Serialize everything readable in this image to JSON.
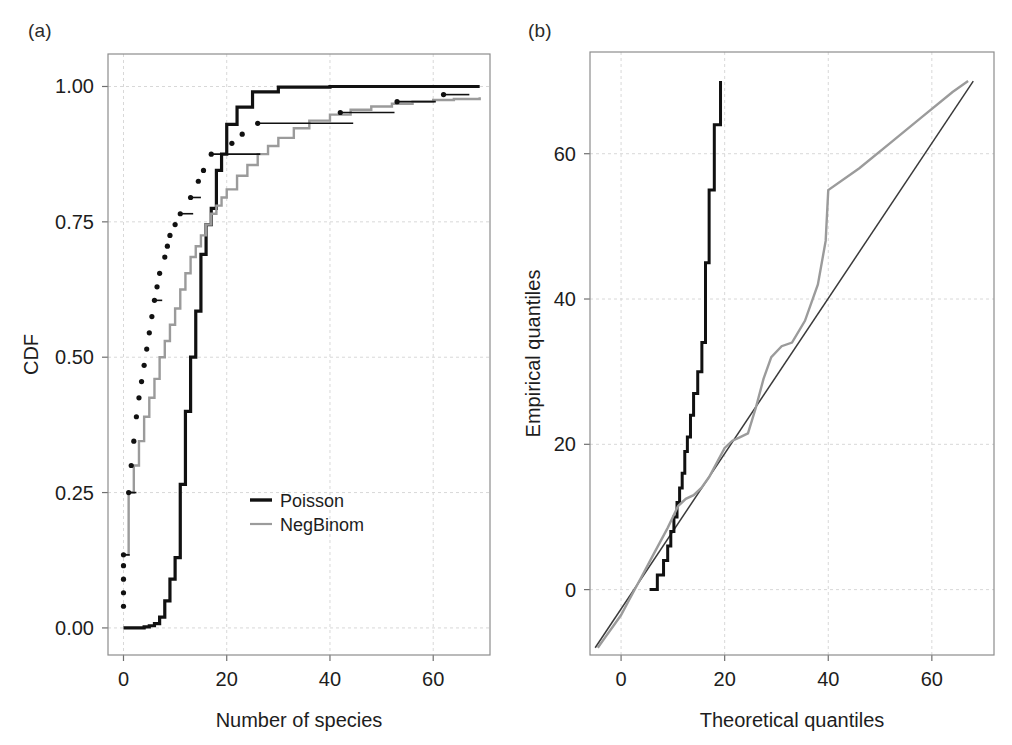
{
  "figure": {
    "panels": [
      {
        "tag": "(a)",
        "xlabel": "Number of species",
        "ylabel": "CDF"
      },
      {
        "tag": "(b)",
        "xlabel": "Theoretical quantiles",
        "ylabel": "Empirical quantiles"
      }
    ]
  },
  "colors": {
    "poisson": "#111111",
    "negbinom": "#9b9b9b",
    "empirical": "#111111",
    "reference": "#3a3a3a",
    "grid": "#d8d8d8",
    "frame": "#8d8d8d"
  },
  "legend": {
    "position": "center-right-inside",
    "items": [
      {
        "label": "Poisson",
        "color": "#111111",
        "width": 3.4
      },
      {
        "label": "NegBinom",
        "color": "#9b9b9b",
        "width": 2.2
      }
    ]
  },
  "chart_data": [
    {
      "type": "line",
      "panel": "(a)",
      "title": "",
      "xlabel": "Number of species",
      "ylabel": "CDF",
      "xlim": [
        -3,
        71
      ],
      "ylim": [
        -0.05,
        1.06
      ],
      "xticks": [
        0,
        20,
        40,
        60
      ],
      "yticks": [
        0.0,
        0.25,
        0.5,
        0.75,
        1.0
      ],
      "xtick_labels": [
        "0",
        "20",
        "40",
        "60"
      ],
      "ytick_labels": [
        "0.00",
        "0.25",
        "0.50",
        "0.75",
        "1.00"
      ],
      "grid": true,
      "series": [
        {
          "name": "Poisson",
          "style": "step",
          "color": "#111111",
          "width": 3.2,
          "x": [
            0,
            1,
            2,
            3,
            4,
            5,
            6,
            7,
            8,
            9,
            10,
            11,
            12,
            13,
            14,
            15,
            16,
            17,
            18,
            19,
            20,
            22,
            25,
            30,
            40,
            50,
            60,
            69
          ],
          "y": [
            0.0,
            0.0,
            0.0,
            0.0,
            0.002,
            0.004,
            0.008,
            0.02,
            0.05,
            0.09,
            0.13,
            0.265,
            0.4,
            0.5,
            0.585,
            0.69,
            0.745,
            0.775,
            0.845,
            0.875,
            0.93,
            0.962,
            0.99,
            0.999,
            1.0,
            1.0,
            1.0,
            1.0
          ]
        },
        {
          "name": "NegBinom",
          "style": "step",
          "color": "#9b9b9b",
          "width": 2.4,
          "x": [
            0,
            1,
            2,
            3,
            4,
            5,
            6,
            7,
            8,
            9,
            10,
            11,
            12,
            13,
            14,
            15,
            16,
            17,
            18,
            19,
            20,
            22,
            24,
            26,
            28,
            30,
            33,
            36,
            40,
            44,
            48,
            52,
            56,
            60,
            64,
            69
          ],
          "y": [
            0.135,
            0.25,
            0.3,
            0.345,
            0.39,
            0.425,
            0.46,
            0.5,
            0.53,
            0.56,
            0.59,
            0.625,
            0.655,
            0.685,
            0.705,
            0.725,
            0.745,
            0.765,
            0.78,
            0.795,
            0.81,
            0.835,
            0.855,
            0.875,
            0.89,
            0.905,
            0.923,
            0.937,
            0.948,
            0.957,
            0.963,
            0.968,
            0.972,
            0.975,
            0.977,
            0.98
          ]
        }
      ],
      "empirical_steps": {
        "name": "Empirical CDF",
        "color": "#111111",
        "description": "black dots with horizontal segments (empirical step function)",
        "points": [
          {
            "x": 0,
            "y": 0.135,
            "run": 1.2
          },
          {
            "x": 0,
            "y": 0.115,
            "run": 0
          },
          {
            "x": 0,
            "y": 0.09,
            "run": 0
          },
          {
            "x": 0,
            "y": 0.065,
            "run": 0
          },
          {
            "x": 0,
            "y": 0.04,
            "run": 0
          },
          {
            "x": 1,
            "y": 0.25,
            "run": 1.5
          },
          {
            "x": 1.5,
            "y": 0.3,
            "run": 0
          },
          {
            "x": 2,
            "y": 0.345,
            "run": 0
          },
          {
            "x": 2.5,
            "y": 0.39,
            "run": 0
          },
          {
            "x": 3,
            "y": 0.425,
            "run": 0
          },
          {
            "x": 3.5,
            "y": 0.455,
            "run": 0
          },
          {
            "x": 4,
            "y": 0.485,
            "run": 0
          },
          {
            "x": 4.5,
            "y": 0.515,
            "run": 0
          },
          {
            "x": 5,
            "y": 0.545,
            "run": 0
          },
          {
            "x": 5.5,
            "y": 0.575,
            "run": 0
          },
          {
            "x": 6,
            "y": 0.605,
            "run": 1.5
          },
          {
            "x": 6.5,
            "y": 0.63,
            "run": 0
          },
          {
            "x": 7,
            "y": 0.655,
            "run": 0
          },
          {
            "x": 8,
            "y": 0.685,
            "run": 0
          },
          {
            "x": 8.5,
            "y": 0.705,
            "run": 0
          },
          {
            "x": 9,
            "y": 0.725,
            "run": 0
          },
          {
            "x": 10,
            "y": 0.745,
            "run": 0
          },
          {
            "x": 11,
            "y": 0.765,
            "run": 2.5
          },
          {
            "x": 13,
            "y": 0.795,
            "run": 2.0
          },
          {
            "x": 14.5,
            "y": 0.825,
            "run": 0
          },
          {
            "x": 15.5,
            "y": 0.845,
            "run": 0
          },
          {
            "x": 17,
            "y": 0.875,
            "run": 9.5
          },
          {
            "x": 21,
            "y": 0.895,
            "run": 0
          },
          {
            "x": 23,
            "y": 0.912,
            "run": 0
          },
          {
            "x": 26,
            "y": 0.932,
            "run": 18.5
          },
          {
            "x": 42,
            "y": 0.952,
            "run": 10.5
          },
          {
            "x": 53,
            "y": 0.972,
            "run": 7.5
          },
          {
            "x": 62,
            "y": 0.985,
            "run": 5.0
          }
        ]
      }
    },
    {
      "type": "line",
      "panel": "(b)",
      "title": "",
      "xlabel": "Theoretical quantiles",
      "ylabel": "Empirical quantiles",
      "xlim": [
        -6,
        72
      ],
      "ylim": [
        -9,
        74
      ],
      "xticks": [
        0,
        20,
        40,
        60
      ],
      "yticks": [
        0,
        20,
        40,
        60
      ],
      "xtick_labels": [
        "0",
        "20",
        "40",
        "60"
      ],
      "ytick_labels": [
        "0",
        "20",
        "40",
        "60"
      ],
      "grid": true,
      "series": [
        {
          "name": "reference-line",
          "style": "line",
          "color": "#3a3a3a",
          "width": 1.5,
          "x": [
            -5,
            68
          ],
          "y": [
            -8,
            70
          ]
        },
        {
          "name": "Poisson",
          "style": "step",
          "color": "#111111",
          "width": 3.0,
          "x": [
            5.5,
            7.0,
            7.0,
            8.2,
            8.2,
            9.0,
            9.0,
            9.6,
            9.6,
            10.2,
            10.2,
            10.8,
            10.8,
            11.3,
            11.3,
            11.8,
            11.8,
            12.3,
            12.3,
            12.8,
            12.8,
            13.4,
            13.4,
            14.0,
            14.0,
            14.8,
            14.8,
            15.6,
            15.6,
            16.3,
            16.3,
            17.0,
            17.0,
            18.0,
            18.0,
            19.2
          ],
          "y": [
            0,
            0,
            2,
            2,
            4,
            4,
            6,
            6,
            8,
            8,
            10,
            10,
            12,
            12,
            14,
            14,
            16,
            16,
            19,
            19,
            21,
            21,
            24,
            24,
            27,
            27,
            30,
            30,
            34,
            34,
            45,
            45,
            55,
            55,
            64,
            70
          ]
        },
        {
          "name": "NegBinom",
          "style": "line",
          "color": "#9b9b9b",
          "width": 2.4,
          "x": [
            -4.5,
            -3.0,
            -1.5,
            0.0,
            1.5,
            3.0,
            4.5,
            6.0,
            7.5,
            9.0,
            10.0,
            11.0,
            12.5,
            14.0,
            15.5,
            17.0,
            18.5,
            20.0,
            21.5,
            23.0,
            24.5,
            26.0,
            27.5,
            29.0,
            31.0,
            33.0,
            35.5,
            38.0,
            39.5,
            40.0,
            46.0,
            52.0,
            58.0,
            64.0,
            67.0
          ],
          "y": [
            -8,
            -6.5,
            -5,
            -3.5,
            -1.5,
            0.5,
            2.5,
            4.5,
            6.5,
            8.5,
            10,
            11.5,
            12.5,
            13,
            14,
            15.5,
            17.5,
            19.5,
            20.5,
            21,
            21.5,
            25,
            29,
            32,
            33.5,
            34,
            37,
            42,
            48,
            55,
            58,
            61.5,
            65,
            68.5,
            70
          ]
        }
      ]
    }
  ]
}
